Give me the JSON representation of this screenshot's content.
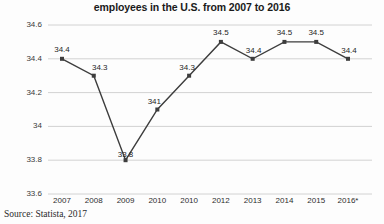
{
  "chart_data": {
    "type": "line",
    "title": "employees in the U.S. from 2007 to 2016",
    "xlabel": "",
    "ylabel": "",
    "categories": [
      "2007",
      "2008",
      "2009",
      "2010",
      "2010",
      "2012",
      "2013",
      "2014",
      "2015",
      "2016*"
    ],
    "values": [
      34.4,
      34.3,
      33.8,
      34.1,
      34.3,
      34.5,
      34.4,
      34.5,
      34.5,
      34.4
    ],
    "point_labels": [
      "34.4",
      "34.3",
      "33.8",
      "341",
      "34.3",
      "34.5",
      "34.4",
      "34.5",
      "34.5",
      "34.4"
    ],
    "ylim": [
      33.6,
      34.6
    ],
    "yticks": [
      "34.6",
      "34.4",
      "34.2",
      "34",
      "33.8",
      "33.6"
    ],
    "ytick_values": [
      34.6,
      34.4,
      34.2,
      34.0,
      33.8,
      33.6
    ],
    "grid": true,
    "legend": false,
    "series_color": "#3d3d3d",
    "grid_color": "#d2d2d2",
    "background_color": "#fdfdfd"
  },
  "source": {
    "text": "Source: Statista, 2017"
  }
}
